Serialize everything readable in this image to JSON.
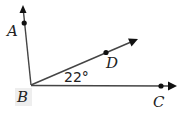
{
  "diagram": {
    "type": "angle-rays",
    "vertex": {
      "label": "B",
      "x": 31,
      "y": 85
    },
    "rays": [
      {
        "name": "BA",
        "through": "A",
        "arrow": {
          "x": 23,
          "y": 7
        }
      },
      {
        "name": "BD",
        "through": "D",
        "arrow": {
          "x": 137,
          "y": 39
        }
      },
      {
        "name": "BC",
        "through": "C",
        "arrow": {
          "x": 176,
          "y": 86
        }
      }
    ],
    "points": [
      {
        "label": "A",
        "x": 24,
        "y": 23
      },
      {
        "label": "D",
        "x": 106,
        "y": 52
      },
      {
        "label": "C",
        "x": 161,
        "y": 86
      }
    ],
    "angle_label": "22°",
    "angle_between": [
      "BD",
      "BC"
    ],
    "colors": {
      "line": "#444444",
      "point": "#111111",
      "label_box": "#eeeeee"
    }
  },
  "labels": {
    "A": "A",
    "B": "B",
    "C": "C",
    "D": "D",
    "angle": "22°"
  }
}
